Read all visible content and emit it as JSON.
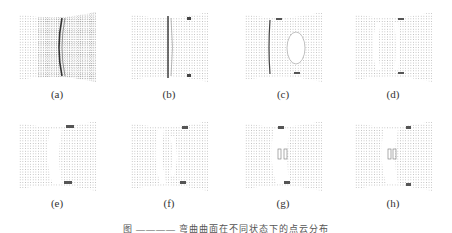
{
  "figure": {
    "panels": [
      {
        "id": "a",
        "label": "(a)"
      },
      {
        "id": "b",
        "label": "(b)"
      },
      {
        "id": "c",
        "label": "(c)"
      },
      {
        "id": "d",
        "label": "(d)"
      },
      {
        "id": "e",
        "label": "(e)"
      },
      {
        "id": "f",
        "label": "(f)"
      },
      {
        "id": "g",
        "label": "(g)"
      },
      {
        "id": "h",
        "label": "(h)"
      }
    ],
    "caption": "图 ———— 弯曲曲面在不同状态下的点云分布"
  },
  "colors": {
    "ink": "#555555",
    "background": "#ffffff"
  }
}
